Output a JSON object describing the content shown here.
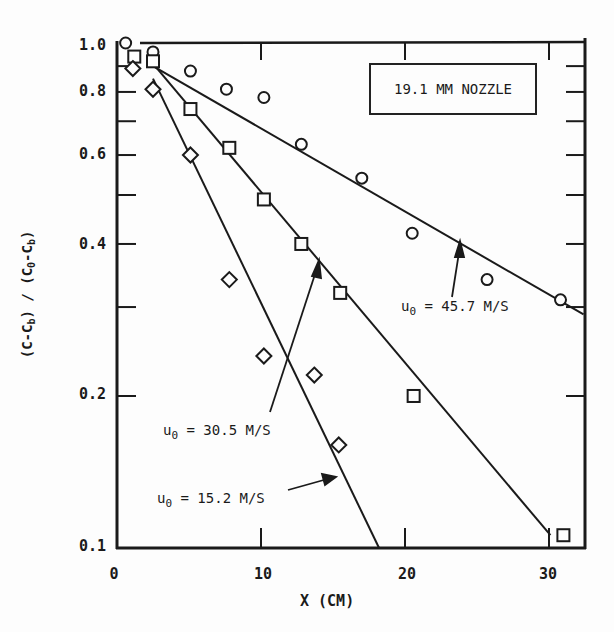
{
  "chart_data": {
    "type": "scatter",
    "title": "19.1 MM NOZZLE",
    "xlabel": "X (CM)",
    "ylabel": "(C-C_b) / (C_0-C_b)",
    "xlim": [
      0,
      32.4
    ],
    "ylim": [
      0.1,
      1.0
    ],
    "yscale": "log",
    "x_ticks": [
      0,
      10,
      20,
      30
    ],
    "y_ticks": [
      0.1,
      0.2,
      0.4,
      0.6,
      0.8,
      1.0
    ],
    "grid": false,
    "legend": "none (inline annotations with arrows)",
    "series": [
      {
        "name": "u_0 = 45.7 M/S",
        "marker": "circle",
        "x": [
          0.6,
          2.5,
          5.1,
          7.6,
          10.2,
          12.8,
          17.0,
          20.5,
          25.7,
          30.8
        ],
        "y": [
          1.0,
          0.96,
          0.88,
          0.81,
          0.78,
          0.63,
          0.54,
          0.42,
          0.34,
          0.31
        ],
        "fit_line": {
          "x": [
            2.5,
            32.4
          ],
          "y": [
            0.9,
            0.29
          ]
        }
      },
      {
        "name": "u_0 = 30.5 M/S",
        "marker": "square",
        "x": [
          1.2,
          2.5,
          5.1,
          7.8,
          10.2,
          12.8,
          15.5,
          20.6,
          31.0
        ],
        "y": [
          0.94,
          0.92,
          0.74,
          0.62,
          0.49,
          0.4,
          0.32,
          0.2,
          0.106
        ],
        "fit_line": {
          "x": [
            2.5,
            30.1
          ],
          "y": [
            0.91,
            0.106
          ]
        }
      },
      {
        "name": "u_0 = 15.2 M/S",
        "marker": "diamond",
        "x": [
          1.1,
          2.5,
          5.1,
          7.8,
          10.2,
          13.7,
          15.4
        ],
        "y": [
          0.89,
          0.81,
          0.6,
          0.34,
          0.24,
          0.22,
          0.16
        ],
        "fit_line": {
          "x": [
            2.5,
            18.2
          ],
          "y": [
            0.85,
            0.1
          ]
        }
      }
    ],
    "annotations": [
      {
        "text": "u_0 = 45.7 M/S",
        "arrow_to": [
          24.3,
          0.39
        ]
      },
      {
        "text": "u_0 = 30.5 M/S",
        "arrow_to": [
          16.3,
          0.37
        ]
      },
      {
        "text": "u_0 = 15.2 M/S",
        "arrow_to": [
          16.0,
          0.14
        ]
      }
    ]
  },
  "labels": {
    "title_box": "19.1 MM NOZZLE",
    "x_axis": "X (CM)",
    "y_axis": {
      "part1": "(C-C",
      "sub1": "b",
      "part2": ") / (C",
      "sub2": "0",
      "part3": "-C",
      "sub3": "b",
      "part4": ")"
    },
    "yticks": [
      "1.0",
      "0.8",
      "0.6",
      "0.4",
      "0.2",
      "0.1"
    ],
    "xticks": [
      "0",
      "10",
      "20",
      "30"
    ],
    "ann_457": {
      "u": "u",
      "sub": "0",
      "rest": " = 45.7 M/S"
    },
    "ann_305": {
      "u": "u",
      "sub": "0",
      "rest": " = 30.5 M/S"
    },
    "ann_152": {
      "u": "u",
      "sub": "0",
      "rest": " = 15.2 M/S"
    }
  }
}
